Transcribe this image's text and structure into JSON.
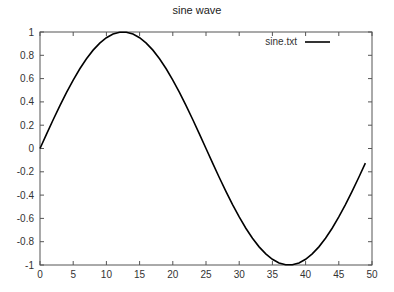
{
  "chart_data": {
    "type": "line",
    "title": "sine wave",
    "xlabel": "",
    "ylabel": "",
    "xlim": [
      0,
      50
    ],
    "ylim": [
      -1,
      1
    ],
    "xticks": [
      0,
      5,
      10,
      15,
      20,
      25,
      30,
      35,
      40,
      45,
      50
    ],
    "yticks": [
      -1,
      -0.8,
      -0.6,
      -0.4,
      -0.2,
      0,
      0.2,
      0.4,
      0.6,
      0.8,
      1
    ],
    "xtick_labels": [
      "0",
      "5",
      "10",
      "15",
      "20",
      "25",
      "30",
      "35",
      "40",
      "45",
      "50"
    ],
    "ytick_labels": [
      "-1",
      "-0.8",
      "-0.6",
      "-0.4",
      "-0.2",
      "0",
      "0.2",
      "0.4",
      "0.6",
      "0.8",
      "1"
    ],
    "grid": false,
    "legend_position": "top-right",
    "series": [
      {
        "name": "sine.txt",
        "color": "#000000",
        "x": [
          0,
          1,
          2,
          3,
          4,
          5,
          6,
          7,
          8,
          9,
          10,
          11,
          12,
          13,
          14,
          15,
          16,
          17,
          18,
          19,
          20,
          21,
          22,
          23,
          24,
          25,
          26,
          27,
          28,
          29,
          30,
          31,
          32,
          33,
          34,
          35,
          36,
          37,
          38,
          39,
          40,
          41,
          42,
          43,
          44,
          45,
          46,
          47,
          48,
          49
        ],
        "values": [
          0.0,
          0.1253,
          0.2487,
          0.3681,
          0.4818,
          0.5878,
          0.6845,
          0.7705,
          0.8443,
          0.9048,
          0.9511,
          0.9823,
          0.998,
          0.998,
          0.9823,
          0.9511,
          0.9048,
          0.8443,
          0.7705,
          0.6845,
          0.5878,
          0.4818,
          0.3681,
          0.2487,
          0.1253,
          0.0,
          -0.1253,
          -0.2487,
          -0.3681,
          -0.4818,
          -0.5878,
          -0.6845,
          -0.7705,
          -0.8443,
          -0.9048,
          -0.9511,
          -0.9823,
          -0.998,
          -0.998,
          -0.9823,
          -0.9511,
          -0.9048,
          -0.8443,
          -0.7705,
          -0.6845,
          -0.5878,
          -0.4818,
          -0.3681,
          -0.2487,
          -0.1253
        ]
      }
    ]
  },
  "layout": {
    "plot": {
      "left": 40,
      "right": 372,
      "top": 32,
      "bottom": 265
    },
    "axis_color": "#555555"
  }
}
